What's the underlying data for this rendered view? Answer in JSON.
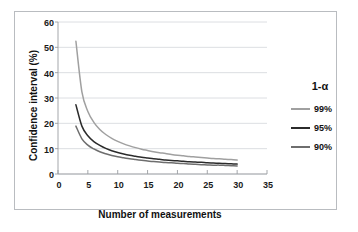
{
  "chart_data": {
    "type": "line",
    "title": "",
    "xlabel": "Number of measurements",
    "ylabel": "Confidence interval (%)",
    "xlim": [
      0,
      35
    ],
    "ylim": [
      0,
      60
    ],
    "xticks": [
      0,
      5,
      10,
      15,
      20,
      25,
      30,
      35
    ],
    "yticks": [
      0,
      10,
      20,
      30,
      40,
      50,
      60
    ],
    "grid": "horizontal",
    "legend_position": "right",
    "legend_title": "1-α",
    "x": [
      3,
      4,
      5,
      6,
      7,
      8,
      9,
      10,
      11,
      12,
      13,
      14,
      15,
      16,
      17,
      18,
      19,
      20,
      21,
      22,
      23,
      24,
      25,
      26,
      27,
      28,
      29,
      30
    ],
    "series": [
      {
        "name": "99%",
        "color": "#a0a0a0",
        "values": [
          52.4,
          32.4,
          24.7,
          20.4,
          17.6,
          15.6,
          14.1,
          12.9,
          11.9,
          11.1,
          10.4,
          9.8,
          9.3,
          8.8,
          8.4,
          8.1,
          7.7,
          7.4,
          7.2,
          6.9,
          6.7,
          6.5,
          6.3,
          6.1,
          6.0,
          5.8,
          5.7,
          5.5
        ]
      },
      {
        "name": "95%",
        "color": "#2b2b2b",
        "values": [
          27.3,
          18.9,
          15.1,
          12.8,
          11.3,
          10.1,
          9.2,
          8.5,
          7.9,
          7.4,
          7.0,
          6.6,
          6.3,
          6.0,
          5.8,
          5.5,
          5.3,
          5.2,
          5.0,
          4.8,
          4.7,
          4.6,
          4.4,
          4.3,
          4.2,
          4.1,
          4.0,
          3.9
        ]
      },
      {
        "name": "90%",
        "color": "#6e6e6e",
        "values": [
          18.9,
          13.9,
          11.4,
          9.9,
          8.8,
          8.0,
          7.3,
          6.8,
          6.4,
          6.0,
          5.7,
          5.4,
          5.1,
          4.9,
          4.7,
          4.5,
          4.4,
          4.2,
          4.1,
          3.9,
          3.8,
          3.7,
          3.6,
          3.5,
          3.5,
          3.4,
          3.3,
          3.2
        ]
      }
    ]
  },
  "axis": {
    "y_title": "Confidence interval (%)",
    "x_title": "Number of measurements",
    "y_tick_labels": [
      "60",
      "50",
      "40",
      "30",
      "20",
      "10",
      "0"
    ],
    "x_tick_labels": [
      "0",
      "5",
      "10",
      "15",
      "20",
      "25",
      "30",
      "35"
    ]
  },
  "legend": {
    "title": "1-α",
    "items": [
      {
        "label": "99%",
        "color": "#a0a0a0"
      },
      {
        "label": "95%",
        "color": "#2b2b2b"
      },
      {
        "label": "90%",
        "color": "#6e6e6e"
      }
    ]
  },
  "colors": {
    "frame_border": "#b9bcc0",
    "gridline": "#d3d6da",
    "axis_line": "#9a9da1",
    "text": "#111111",
    "background": "#ffffff"
  }
}
